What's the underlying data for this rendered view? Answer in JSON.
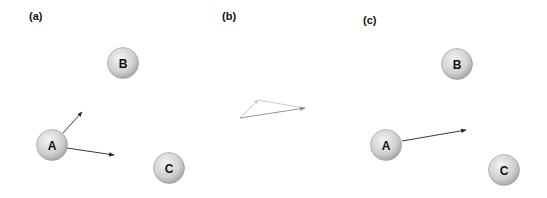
{
  "panels": {
    "a": {
      "label": "(a)",
      "nodes": {
        "A": "A",
        "B": "B",
        "C": "C"
      }
    },
    "b": {
      "label": "(b)"
    },
    "c": {
      "label": "(c)",
      "nodes": {
        "A": "A",
        "B": "B",
        "C": "C"
      }
    }
  },
  "colors": {
    "node_fill_light": "#f2f2f2",
    "node_fill_dark": "#b0b0b0",
    "arrow": "#222222",
    "arrow_faint": "#b8b8b8",
    "arrow_mid": "#8a8a8a"
  }
}
